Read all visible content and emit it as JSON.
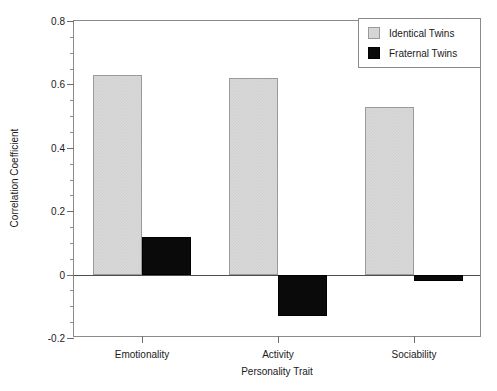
{
  "chart_data": {
    "type": "bar",
    "title": "",
    "subtitle": "",
    "xlabel": "Personality Trait",
    "ylabel": "Correlation Coefficient",
    "categories": [
      "Emotionality",
      "Activity",
      "Sociability"
    ],
    "series": [
      {
        "name": "Identical Twins",
        "color": "#d9d9d9",
        "values": [
          0.63,
          0.62,
          0.53
        ]
      },
      {
        "name": "Fraternal Twins",
        "color": "#0a0a0a",
        "values": [
          0.12,
          -0.13,
          -0.02
        ]
      }
    ],
    "ylim": [
      -0.2,
      0.8
    ],
    "yticks": [
      -0.2,
      0,
      0.2,
      0.4,
      0.6,
      0.8
    ],
    "ytick_labels": [
      "-0.2",
      "0",
      "0.2",
      "0.4",
      "0.6",
      "0.8"
    ],
    "ytick_minor_step": 0.05,
    "grid": false,
    "legend_position": "top-right",
    "frame": true
  },
  "legend": {
    "entries": [
      {
        "label": "Identical Twins",
        "swatch": "identical"
      },
      {
        "label": "Fraternal Twins",
        "swatch": "fraternal"
      }
    ]
  },
  "axis_titles": {
    "x": "Personality Trait",
    "y": "Correlation Coefficient"
  }
}
